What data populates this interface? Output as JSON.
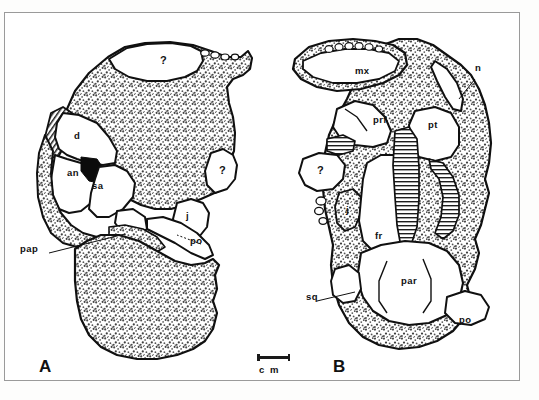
{
  "figure": {
    "caption_absent": true,
    "scale_bar": {
      "unit_label": "c m",
      "length_label": ""
    },
    "panels": [
      {
        "letter": "A",
        "view": "left lateral view of skull block",
        "labels": [
          {
            "text": "?",
            "kind": "query",
            "x": 155,
            "y": 47
          },
          {
            "text": "d",
            "kind": "bone",
            "x": 69,
            "y": 123
          },
          {
            "text": "an",
            "kind": "bone",
            "x": 63,
            "y": 160
          },
          {
            "text": "sa",
            "kind": "bone",
            "x": 88,
            "y": 173
          },
          {
            "text": "?",
            "kind": "query",
            "x": 215,
            "y": 157
          },
          {
            "text": "j",
            "kind": "bone",
            "x": 181,
            "y": 203
          },
          {
            "text": "po",
            "kind": "bone",
            "x": 186,
            "y": 228
          },
          {
            "text": "pap",
            "kind": "bone",
            "x": 16,
            "y": 236
          }
        ],
        "leader_lines": [
          {
            "from": [
              44,
              240
            ],
            "to": [
              118,
              222
            ]
          },
          {
            "from": [
              196,
              231
            ],
            "to": [
              176,
              224
            ]
          }
        ]
      },
      {
        "letter": "B",
        "view": "dorsal view of skull block",
        "labels": [
          {
            "text": "mx",
            "kind": "bone",
            "x": 353,
            "y": 58
          },
          {
            "text": "n",
            "kind": "bone",
            "x": 471,
            "y": 55
          },
          {
            "text": "prf",
            "kind": "bone",
            "x": 369,
            "y": 107
          },
          {
            "text": "pt",
            "kind": "bone",
            "x": 424,
            "y": 112
          },
          {
            "text": "?",
            "kind": "query",
            "x": 319,
            "y": 158
          },
          {
            "text": "j",
            "kind": "bone",
            "x": 346,
            "y": 197
          },
          {
            "text": "fr",
            "kind": "bone",
            "x": 371,
            "y": 223
          },
          {
            "text": "sq",
            "kind": "bone",
            "x": 306,
            "y": 284
          },
          {
            "text": "par",
            "kind": "bone",
            "x": 399,
            "y": 268
          },
          {
            "text": "po",
            "kind": "bone",
            "x": 456,
            "y": 307
          }
        ],
        "leader_lines": [
          {
            "from": [
              323,
              287
            ],
            "to": [
              360,
              279
            ]
          },
          {
            "from": [
              474,
              62
            ],
            "to": [
              456,
              80
            ]
          }
        ]
      }
    ],
    "colors": {
      "ink": "#111111",
      "matrix_stipple": "#6d6d6d",
      "bone_fill": "#ffffff",
      "frame": "#9a9a9a",
      "background": "#ffffff"
    }
  }
}
